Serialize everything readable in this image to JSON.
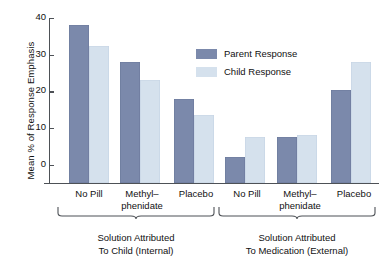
{
  "chart_data": {
    "type": "bar",
    "title": "",
    "xlabel": "",
    "ylabel": "Mean % of Response Emphasis",
    "ylim": [
      0,
      45
    ],
    "yticks": [
      0,
      10,
      20,
      30,
      40
    ],
    "ytick_labels": [
      "0",
      "10",
      "20",
      "30",
      "40"
    ],
    "grid": false,
    "legend_position": "upper-center-right",
    "categories": [
      "No Pill",
      "Methyl–phenidate",
      "Placebo",
      "No Pill",
      "Methyl–phenidate",
      "Placebo"
    ],
    "series": [
      {
        "name": "Parent Response",
        "color": "#7b89ab",
        "values": [
          43,
          33,
          23,
          7,
          12.5,
          25.5
        ]
      },
      {
        "name": "Child Response",
        "color": "#d5e1ed",
        "values": [
          37.5,
          28,
          18.5,
          12.5,
          13,
          33
        ]
      }
    ],
    "groups": [
      {
        "caption_line1": "Solution Attributed",
        "caption_line2": "To Child (Internal)",
        "categories": [
          "No Pill",
          "Methyl–phenidate",
          "Placebo"
        ]
      },
      {
        "caption_line1": "Solution Attributed",
        "caption_line2": "To Medication (External)",
        "categories": [
          "No Pill",
          "Methyl–phenidate",
          "Placebo"
        ]
      }
    ]
  },
  "axis": {
    "ylabel": "Mean % of Response Emphasis",
    "ticks": [
      {
        "value": 40,
        "label": "40"
      },
      {
        "value": 30,
        "label": "30"
      },
      {
        "value": 20,
        "label": "20"
      },
      {
        "value": 10,
        "label": "10"
      },
      {
        "value": 0,
        "label": "0"
      }
    ]
  },
  "legend": {
    "items": [
      {
        "label": "Parent Response",
        "color": "#7b89ab"
      },
      {
        "label": "Child Response",
        "color": "#d5e1ed"
      }
    ]
  },
  "xcats": [
    {
      "line1": "No Pill",
      "line2": ""
    },
    {
      "line1": "Methyl–",
      "line2": "phenidate"
    },
    {
      "line1": "Placebo",
      "line2": ""
    },
    {
      "line1": "No Pill",
      "line2": ""
    },
    {
      "line1": "Methyl–",
      "line2": "phenidate"
    },
    {
      "line1": "Placebo",
      "line2": ""
    }
  ],
  "groups": [
    {
      "caption_line1": "Solution Attributed",
      "caption_line2": "To Child (Internal)"
    },
    {
      "caption_line1": "Solution Attributed",
      "caption_line2": "To Medication (External)"
    }
  ]
}
